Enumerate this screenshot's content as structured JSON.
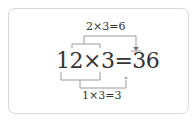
{
  "diagram": {
    "top_equation": "2×3=6",
    "main_equation": "12×3=36",
    "bottom_equation": "1×3=3",
    "line_color": "#999999",
    "text_color": "#333333",
    "border_color": "#d8d8d8"
  }
}
